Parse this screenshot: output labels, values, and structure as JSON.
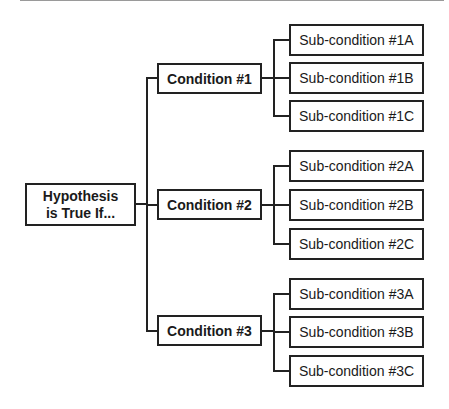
{
  "diagram": {
    "root": {
      "line1": "Hypothesis",
      "line2": "is True If..."
    },
    "conditions": [
      {
        "label": "Condition #1",
        "subs": [
          "Sub-condition #1A",
          "Sub-condition #1B",
          "Sub-condition #1C"
        ]
      },
      {
        "label": "Condition #2",
        "subs": [
          "Sub-condition #2A",
          "Sub-condition #2B",
          "Sub-condition #2C"
        ]
      },
      {
        "label": "Condition #3",
        "subs": [
          "Sub-condition #3A",
          "Sub-condition #3B",
          "Sub-condition #3C"
        ]
      }
    ]
  }
}
